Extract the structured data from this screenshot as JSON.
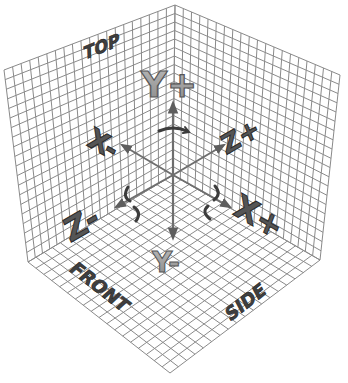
{
  "diagram": {
    "planes": {
      "left_wall": {
        "name": "front-left wall",
        "divisions_u": 20,
        "divisions_v": 20
      },
      "right_wall": {
        "name": "right wall",
        "divisions_u": 20,
        "divisions_v": 20
      },
      "floor": {
        "name": "floor",
        "divisions_u": 18,
        "divisions_v": 18
      }
    },
    "face_labels": {
      "top": "TOP",
      "front": "FRONT",
      "side": "SIDE"
    },
    "axis_labels": {
      "y_plus": "Y+",
      "y_minus": "Y-",
      "x_minus": "X-",
      "x_plus": "X+",
      "z_plus": "Z+",
      "z_minus": "Z-"
    },
    "colors": {
      "background": "#ffffff",
      "grid": "#8a8a8a",
      "axis": "#6e6e6e",
      "label_light": "#9c9c9c",
      "label_dark": "#4a4a4a"
    }
  }
}
